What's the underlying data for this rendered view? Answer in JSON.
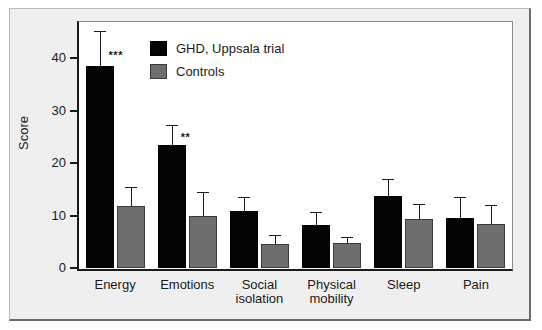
{
  "chart_data": {
    "type": "bar",
    "title": "",
    "subtitle": "",
    "xlabel": "",
    "ylabel": "Score",
    "ylim": [
      0,
      45
    ],
    "yticks": [
      0,
      10,
      20,
      30,
      40
    ],
    "ytick_labels": [
      "0",
      "10",
      "20",
      "30",
      "40"
    ],
    "grid": false,
    "legend_position": "top-center-inside",
    "categories": [
      "Energy",
      "Emotions",
      "Social\nisolation",
      "Physical\nmobility",
      "Sleep",
      "Pain"
    ],
    "series": [
      {
        "name": "GHD, Uppsala trial",
        "color": "#050505",
        "values": [
          38.5,
          23.5,
          10.8,
          8.1,
          13.7,
          9.6
        ],
        "errors_upper": [
          45.2,
          27.2,
          13.6,
          10.7,
          17.0,
          13.5
        ]
      },
      {
        "name": "Controls",
        "color": "#6e6e6e",
        "values": [
          11.9,
          10.0,
          4.6,
          4.8,
          9.4,
          8.3
        ],
        "errors_upper": [
          15.5,
          14.5,
          6.3,
          6.0,
          12.2,
          12.0
        ]
      }
    ],
    "annotations": [
      {
        "category": "Energy",
        "text": "***",
        "at_value": 41.5
      },
      {
        "category": "Emotions",
        "text": "**",
        "at_value": 26.0
      }
    ]
  },
  "legend": {
    "items": [
      {
        "label": "GHD, Uppsala trial",
        "swatch": "treatment"
      },
      {
        "label": "Controls",
        "swatch": "control"
      }
    ]
  },
  "axis": {
    "y_title": "Score",
    "y_labels": [
      "40",
      "30",
      "20",
      "10",
      "0"
    ]
  },
  "x_labels": [
    {
      "line1": "Energy",
      "line2": ""
    },
    {
      "line1": "Emotions",
      "line2": ""
    },
    {
      "line1": "Social",
      "line2": "isolation"
    },
    {
      "line1": "Physical",
      "line2": "mobility"
    },
    {
      "line1": "Sleep",
      "line2": ""
    },
    {
      "line1": "Pain",
      "line2": ""
    }
  ]
}
